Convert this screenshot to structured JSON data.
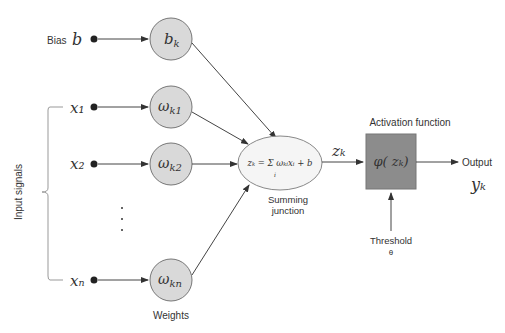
{
  "labels": {
    "bias": "Bias",
    "bias_symbol": "b",
    "inputs": [
      "x₁",
      "x₂",
      "xₙ"
    ],
    "weights": [
      "b",
      "ω",
      "ω",
      "ω"
    ],
    "weight_subs": [
      "k",
      "k1",
      "k2",
      "kn"
    ],
    "input_signals": "Input signals",
    "weights_label": "Weights",
    "summing_line1": "Summing",
    "summing_line2": "junction",
    "sum_formula": "zₖ = Σ ωₖᵢxᵢ + b",
    "sum_index": "i",
    "zk": "zₖ",
    "activation_title": "Activation function",
    "activation_formula": "φ( zₖ)",
    "output": "Output",
    "yk": "yₖ",
    "threshold": "Threshold",
    "theta": "θ"
  },
  "colors": {
    "node_fill": "#d9d9d9",
    "node_stroke": "#777777",
    "activation_fill": "#8c8c8c",
    "ellipse_fill": "#f5f5f5"
  }
}
